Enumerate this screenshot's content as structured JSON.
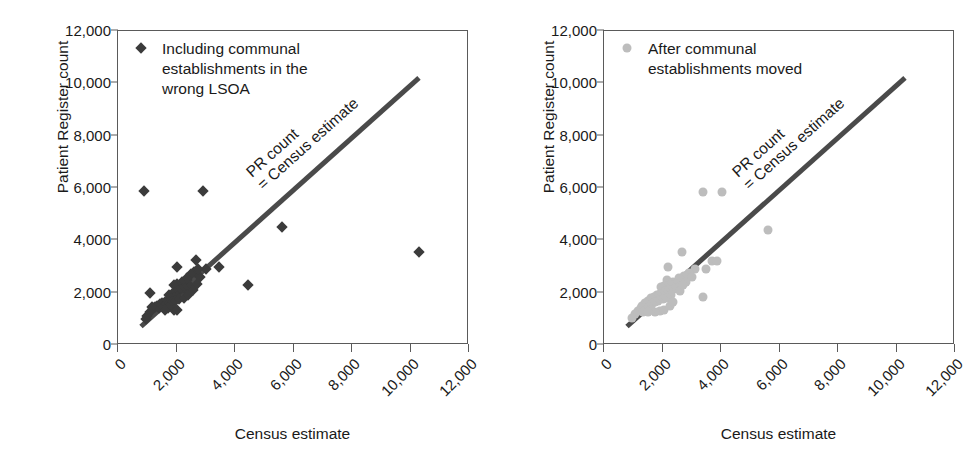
{
  "figure": {
    "background": "#ffffff",
    "panel_count": 2
  },
  "axes": {
    "x_title": "Census estimate",
    "y_title": "Patient Register count",
    "x_ticks": [
      "0",
      "2,000",
      "4,000",
      "6,000",
      "8,000",
      "10,000",
      "12,000"
    ],
    "y_ticks": [
      "12,000",
      "10,000",
      "8,000",
      "6,000",
      "4,000",
      "2,000",
      "0"
    ],
    "x_tick_values": [
      0,
      2000,
      4000,
      6000,
      8000,
      10000,
      12000
    ],
    "y_tick_values": [
      12000,
      10000,
      8000,
      6000,
      4000,
      2000,
      0
    ],
    "x_range": [
      0,
      12000
    ],
    "y_range": [
      0,
      12000
    ],
    "grid": false
  },
  "annotation": {
    "line1": "PR count",
    "line2": "= Census estimate",
    "color": "#4a4a4a"
  },
  "left_panel": {
    "legend_label": "Including communal\nestablishments in the\nwrong LSOA",
    "marker_shape": "diamond",
    "marker_color": "#3b3b3b"
  },
  "right_panel": {
    "legend_label": "After communal\nestablishments moved",
    "marker_shape": "circle",
    "marker_color": "#bdbdbd"
  },
  "chart_data": [
    {
      "type": "scatter",
      "title": "Including communal establishments in the wrong LSOA",
      "xlabel": "Census estimate",
      "ylabel": "Patient Register count",
      "xlim": [
        0,
        12000
      ],
      "ylim": [
        0,
        12000
      ],
      "grid": false,
      "legend_position": "top-left-inside",
      "marker": "diamond",
      "marker_color": "#3b3b3b",
      "reference_line": {
        "label": "PR count = Census estimate",
        "type": "identity",
        "from": [
          800,
          800
        ],
        "to": [
          10300,
          10300
        ],
        "color": "#4a4a4a"
      },
      "points": [
        [
          900,
          5900
        ],
        [
          2900,
          5900
        ],
        [
          5600,
          4500
        ],
        [
          10300,
          3550
        ],
        [
          4450,
          2300
        ],
        [
          3450,
          2980
        ],
        [
          3000,
          2900
        ],
        [
          2650,
          3250
        ],
        [
          2000,
          3000
        ],
        [
          2350,
          2500
        ],
        [
          2200,
          2400
        ],
        [
          2000,
          2350
        ],
        [
          1900,
          2300
        ],
        [
          2450,
          2250
        ],
        [
          2300,
          2150
        ],
        [
          2150,
          2100
        ],
        [
          2050,
          2050
        ],
        [
          1950,
          2000
        ],
        [
          1100,
          2000
        ],
        [
          1850,
          1950
        ],
        [
          1750,
          1900
        ],
        [
          2000,
          1850
        ],
        [
          1900,
          1800
        ],
        [
          1800,
          1750
        ],
        [
          1700,
          1700
        ],
        [
          1600,
          1650
        ],
        [
          1500,
          1600
        ],
        [
          1450,
          1550
        ],
        [
          1350,
          1500
        ],
        [
          1250,
          1450
        ],
        [
          1200,
          1400
        ],
        [
          1400,
          1400
        ],
        [
          1550,
          1450
        ],
        [
          1650,
          1550
        ],
        [
          1750,
          1600
        ],
        [
          1850,
          1650
        ],
        [
          1950,
          1700
        ],
        [
          2100,
          1750
        ],
        [
          2250,
          1800
        ],
        [
          2400,
          1900
        ],
        [
          2550,
          2100
        ],
        [
          2700,
          2350
        ],
        [
          2800,
          2600
        ],
        [
          1900,
          1350
        ],
        [
          2000,
          1350
        ],
        [
          1150,
          1450
        ],
        [
          1700,
          1400
        ],
        [
          1600,
          1350
        ],
        [
          1100,
          1250
        ],
        [
          1000,
          1100
        ],
        [
          950,
          1000
        ],
        [
          2600,
          2800
        ],
        [
          2750,
          2900
        ],
        [
          2500,
          2700
        ],
        [
          2350,
          2550
        ]
      ]
    },
    {
      "type": "scatter",
      "title": "After communal establishments moved",
      "xlabel": "Census estimate",
      "ylabel": "Patient Register count",
      "xlim": [
        0,
        12000
      ],
      "ylim": [
        0,
        12000
      ],
      "grid": false,
      "legend_position": "top-left-inside",
      "marker": "circle",
      "marker_color": "#bdbdbd",
      "reference_line": {
        "label": "PR count = Census estimate",
        "type": "identity",
        "from": [
          800,
          800
        ],
        "to": [
          10300,
          10300
        ],
        "color": "#4a4a4a"
      },
      "points": [
        [
          3400,
          5850
        ],
        [
          4050,
          5850
        ],
        [
          5600,
          4400
        ],
        [
          2650,
          3550
        ],
        [
          3400,
          1850
        ],
        [
          3700,
          3200
        ],
        [
          3850,
          3200
        ],
        [
          3500,
          2900
        ],
        [
          3100,
          2900
        ],
        [
          2200,
          2980
        ],
        [
          2900,
          2750
        ],
        [
          2750,
          2650
        ],
        [
          2550,
          2550
        ],
        [
          2150,
          2500
        ],
        [
          2350,
          2400
        ],
        [
          2450,
          2350
        ],
        [
          2250,
          2300
        ],
        [
          2050,
          2250
        ],
        [
          1950,
          2200
        ],
        [
          2550,
          2200
        ],
        [
          2400,
          2150
        ],
        [
          2200,
          2100
        ],
        [
          2100,
          2050
        ],
        [
          2000,
          2000
        ],
        [
          1900,
          1950
        ],
        [
          1800,
          1900
        ],
        [
          2300,
          1900
        ],
        [
          1700,
          1850
        ],
        [
          2150,
          1800
        ],
        [
          1600,
          1800
        ],
        [
          2000,
          1750
        ],
        [
          1850,
          1700
        ],
        [
          1500,
          1700
        ],
        [
          1750,
          1650
        ],
        [
          1400,
          1600
        ],
        [
          1650,
          1550
        ],
        [
          1300,
          1500
        ],
        [
          1550,
          1450
        ],
        [
          1250,
          1400
        ],
        [
          1450,
          1350
        ],
        [
          1150,
          1300
        ],
        [
          1900,
          1300
        ],
        [
          2050,
          1350
        ],
        [
          1350,
          1250
        ],
        [
          1050,
          1200
        ],
        [
          1750,
          1250
        ],
        [
          2250,
          1500
        ],
        [
          2350,
          1650
        ],
        [
          2600,
          2050
        ],
        [
          2800,
          2400
        ],
        [
          3000,
          2600
        ],
        [
          2700,
          2300
        ],
        [
          1600,
          1350
        ],
        [
          1500,
          1250
        ],
        [
          950,
          1050
        ]
      ]
    }
  ]
}
